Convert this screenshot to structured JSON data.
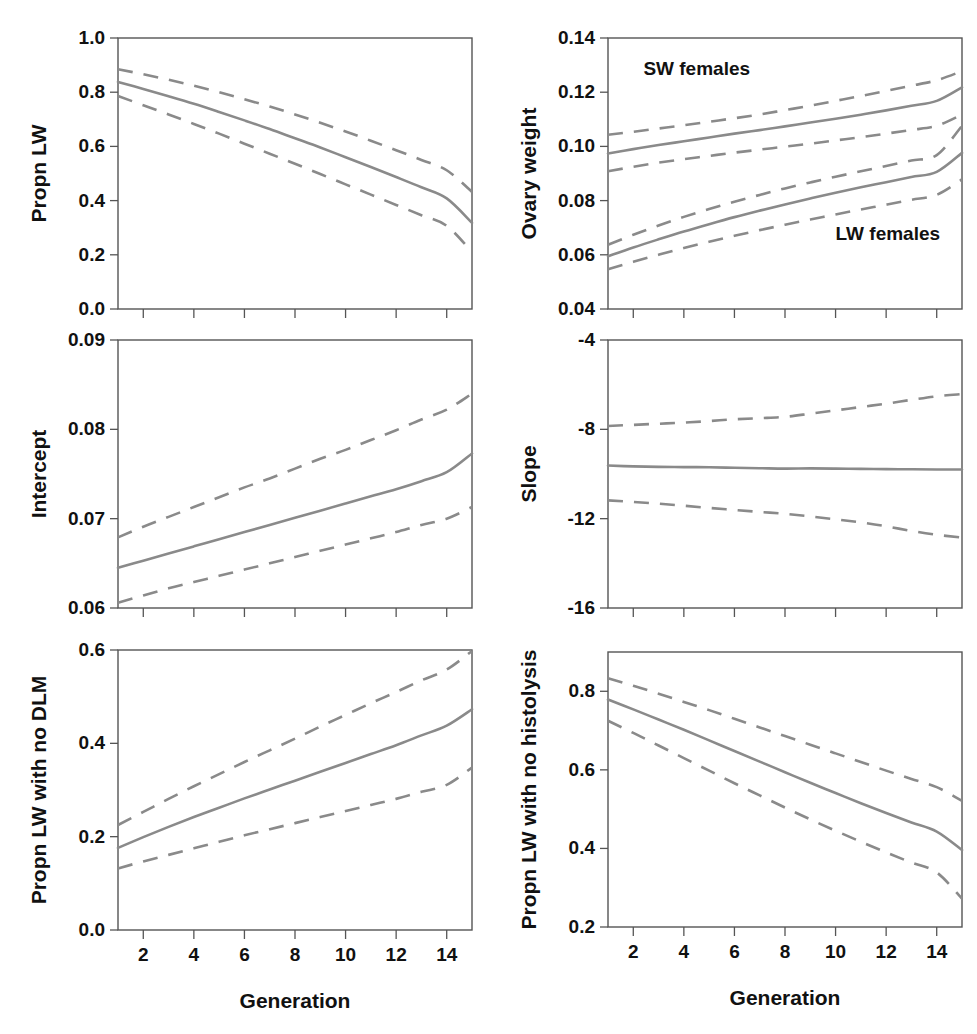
{
  "figure": {
    "width": 977,
    "height": 1034,
    "line_color": "#8a8a8a",
    "axis_color": "#555555",
    "text_color": "#111111",
    "xlabel": "Generation",
    "xticks": [
      2,
      4,
      6,
      8,
      10,
      12,
      14
    ],
    "xtick_labels": [
      "2",
      "4",
      "6",
      "8",
      "10",
      "12",
      "14"
    ],
    "xlim": [
      1,
      15
    ]
  },
  "chart_data": [
    {
      "id": "propn-lw",
      "type": "line",
      "position": "top-left",
      "title": "",
      "xlabel": "Generation",
      "ylabel": "Propn LW",
      "xlim": [
        1,
        15
      ],
      "ylim": [
        0.0,
        1.0
      ],
      "yticks": [
        0.0,
        0.2,
        0.4,
        0.6,
        0.8,
        1.0
      ],
      "ytick_labels": [
        "0.0",
        "0.2",
        "0.4",
        "0.6",
        "0.8",
        "1.0"
      ],
      "x": [
        1,
        2,
        3,
        4,
        5,
        6,
        7,
        8,
        9,
        10,
        11,
        12,
        13,
        14,
        15
      ],
      "grid": false,
      "legend": "none",
      "annotations": [],
      "series": [
        {
          "name": "upper 95% CI",
          "style": "dashed",
          "values": [
            0.885,
            0.866,
            0.846,
            0.824,
            0.8,
            0.774,
            0.747,
            0.718,
            0.687,
            0.655,
            0.621,
            0.586,
            0.55,
            0.512,
            0.432
          ]
        },
        {
          "name": "mean",
          "style": "solid",
          "values": [
            0.838,
            0.812,
            0.785,
            0.757,
            0.727,
            0.696,
            0.664,
            0.63,
            0.596,
            0.56,
            0.524,
            0.487,
            0.449,
            0.408,
            0.318
          ]
        },
        {
          "name": "lower 95% CI",
          "style": "dashed",
          "values": [
            0.786,
            0.752,
            0.718,
            0.683,
            0.647,
            0.61,
            0.573,
            0.536,
            0.498,
            0.46,
            0.422,
            0.384,
            0.346,
            0.307,
            0.21
          ]
        }
      ]
    },
    {
      "id": "ovary-weight",
      "type": "line",
      "position": "top-right",
      "title": "",
      "xlabel": "Generation",
      "ylabel": "Ovary weight",
      "xlim": [
        1,
        15
      ],
      "ylim": [
        0.04,
        0.14
      ],
      "yticks": [
        0.04,
        0.06,
        0.08,
        0.1,
        0.12,
        0.14
      ],
      "ytick_labels": [
        "0.04",
        "0.06",
        "0.08",
        "0.10",
        "0.12",
        "0.14"
      ],
      "x": [
        1,
        2,
        3,
        4,
        5,
        6,
        7,
        8,
        9,
        10,
        11,
        12,
        13,
        14,
        15
      ],
      "grid": false,
      "legend": "inline-annotations",
      "annotations": [
        {
          "text": "SW females",
          "x": 2.4,
          "y": 0.1265
        },
        {
          "text": "LW females",
          "x": 10.0,
          "y": 0.0655
        }
      ],
      "series": [
        {
          "name": "SW females upper 95% CI",
          "style": "dashed",
          "values": [
            0.1043,
            0.1054,
            0.1066,
            0.1078,
            0.1091,
            0.1104,
            0.1118,
            0.1134,
            0.115,
            0.1168,
            0.1186,
            0.1205,
            0.1224,
            0.1244,
            0.1278
          ]
        },
        {
          "name": "SW females mean",
          "style": "solid",
          "values": [
            0.0974,
            0.099,
            0.1005,
            0.1019,
            0.1033,
            0.1047,
            0.106,
            0.1074,
            0.1088,
            0.1102,
            0.1117,
            0.1133,
            0.115,
            0.1168,
            0.1218
          ]
        },
        {
          "name": "SW females lower 95% CI",
          "style": "dashed",
          "values": [
            0.0908,
            0.0925,
            0.094,
            0.0953,
            0.0965,
            0.0977,
            0.0988,
            0.0999,
            0.101,
            0.1022,
            0.1034,
            0.1047,
            0.1061,
            0.1076,
            0.1118
          ]
        },
        {
          "name": "LW females upper 95% CI",
          "style": "dashed",
          "values": [
            0.0637,
            0.0674,
            0.0708,
            0.074,
            0.0769,
            0.0796,
            0.0821,
            0.0845,
            0.0867,
            0.0888,
            0.0908,
            0.0928,
            0.0948,
            0.0968,
            0.1076
          ]
        },
        {
          "name": "LW females mean",
          "style": "solid",
          "values": [
            0.0595,
            0.0627,
            0.0657,
            0.0686,
            0.0713,
            0.0739,
            0.0763,
            0.0786,
            0.0808,
            0.0829,
            0.0849,
            0.0868,
            0.0887,
            0.0906,
            0.0976
          ]
        },
        {
          "name": "LW females lower 95% CI",
          "style": "dashed",
          "values": [
            0.0547,
            0.0574,
            0.06,
            0.0625,
            0.0648,
            0.067,
            0.0691,
            0.0711,
            0.073,
            0.0749,
            0.0767,
            0.0785,
            0.0803,
            0.0821,
            0.0878
          ]
        }
      ]
    },
    {
      "id": "intercept",
      "type": "line",
      "position": "middle-left",
      "title": "",
      "xlabel": "Generation",
      "ylabel": "Intercept",
      "xlim": [
        1,
        15
      ],
      "ylim": [
        0.06,
        0.09
      ],
      "yticks": [
        0.06,
        0.07,
        0.08,
        0.09
      ],
      "ytick_labels": [
        "0.06",
        "0.07",
        "0.08",
        "0.09"
      ],
      "x": [
        1,
        2,
        3,
        4,
        5,
        6,
        7,
        8,
        9,
        10,
        11,
        12,
        13,
        14,
        15
      ],
      "grid": false,
      "legend": "none",
      "annotations": [],
      "series": [
        {
          "name": "upper 95% CI",
          "style": "dashed",
          "values": [
            0.0679,
            0.0691,
            0.0702,
            0.0713,
            0.0724,
            0.0735,
            0.0745,
            0.0756,
            0.0767,
            0.0777,
            0.0788,
            0.0799,
            0.0811,
            0.0822,
            0.084
          ]
        },
        {
          "name": "mean",
          "style": "solid",
          "values": [
            0.0645,
            0.0653,
            0.0661,
            0.0669,
            0.0677,
            0.0685,
            0.0693,
            0.0701,
            0.0709,
            0.0717,
            0.0725,
            0.0733,
            0.0742,
            0.0752,
            0.0773
          ]
        },
        {
          "name": "lower 95% CI",
          "style": "dashed",
          "values": [
            0.0606,
            0.0614,
            0.0622,
            0.0629,
            0.0636,
            0.0643,
            0.065,
            0.0657,
            0.0664,
            0.0671,
            0.0678,
            0.0685,
            0.0693,
            0.07,
            0.0713
          ]
        }
      ]
    },
    {
      "id": "slope",
      "type": "line",
      "position": "middle-right",
      "title": "",
      "xlabel": "Generation",
      "ylabel": "Slope",
      "xlim": [
        1,
        15
      ],
      "ylim": [
        -16,
        -4
      ],
      "yticks": [
        -16,
        -12,
        -8,
        -4
      ],
      "ytick_labels": [
        "-16",
        "-12",
        "-8",
        "-4"
      ],
      "x": [
        1,
        2,
        3,
        4,
        5,
        6,
        7,
        8,
        9,
        10,
        11,
        12,
        13,
        14,
        15
      ],
      "grid": false,
      "legend": "none",
      "annotations": [],
      "series": [
        {
          "name": "upper 95% CI",
          "style": "dashed",
          "values": [
            -7.85,
            -7.8,
            -7.75,
            -7.7,
            -7.63,
            -7.55,
            -7.5,
            -7.44,
            -7.3,
            -7.15,
            -7.0,
            -6.85,
            -6.68,
            -6.52,
            -6.42
          ]
        },
        {
          "name": "mean",
          "style": "solid",
          "values": [
            -9.62,
            -9.66,
            -9.68,
            -9.69,
            -9.7,
            -9.72,
            -9.74,
            -9.76,
            -9.75,
            -9.76,
            -9.77,
            -9.78,
            -9.79,
            -9.8,
            -9.8
          ]
        },
        {
          "name": "lower 95% CI",
          "style": "dashed",
          "values": [
            -11.18,
            -11.25,
            -11.33,
            -11.42,
            -11.52,
            -11.61,
            -11.7,
            -11.78,
            -11.9,
            -12.03,
            -12.17,
            -12.34,
            -12.55,
            -12.72,
            -12.85
          ]
        }
      ]
    },
    {
      "id": "propn-lw-no-dlm",
      "type": "line",
      "position": "bottom-left",
      "title": "",
      "xlabel": "Generation",
      "ylabel": "Propn LW with no DLM",
      "xlim": [
        1,
        15
      ],
      "ylim": [
        0.0,
        0.6
      ],
      "yticks": [
        0.0,
        0.2,
        0.4,
        0.6
      ],
      "ytick_labels": [
        "0.0",
        "0.2",
        "0.4",
        "0.6"
      ],
      "x": [
        1,
        2,
        3,
        4,
        5,
        6,
        7,
        8,
        9,
        10,
        11,
        12,
        13,
        14,
        15
      ],
      "grid": false,
      "legend": "none",
      "annotations": [],
      "series": [
        {
          "name": "upper 95% CI",
          "style": "dashed",
          "values": [
            0.225,
            0.253,
            0.281,
            0.308,
            0.334,
            0.36,
            0.385,
            0.41,
            0.436,
            0.461,
            0.486,
            0.51,
            0.535,
            0.558,
            0.598
          ]
        },
        {
          "name": "mean",
          "style": "solid",
          "values": [
            0.176,
            0.199,
            0.221,
            0.242,
            0.262,
            0.282,
            0.301,
            0.32,
            0.339,
            0.358,
            0.377,
            0.396,
            0.417,
            0.438,
            0.473
          ]
        },
        {
          "name": "lower 95% CI",
          "style": "dashed",
          "values": [
            0.132,
            0.147,
            0.161,
            0.175,
            0.189,
            0.203,
            0.216,
            0.229,
            0.242,
            0.255,
            0.268,
            0.281,
            0.296,
            0.311,
            0.348
          ]
        }
      ]
    },
    {
      "id": "propn-lw-no-histolysis",
      "type": "line",
      "position": "bottom-right",
      "title": "",
      "xlabel": "Generation",
      "ylabel": "Propn LW with no histolysis",
      "xlim": [
        1,
        15
      ],
      "ylim": [
        0.2,
        0.9
      ],
      "yticks": [
        0.2,
        0.4,
        0.6,
        0.8
      ],
      "ytick_labels": [
        "0.2",
        "0.4",
        "0.6",
        "0.8"
      ],
      "x": [
        1,
        2,
        3,
        4,
        5,
        6,
        7,
        8,
        9,
        10,
        11,
        12,
        13,
        14,
        15
      ],
      "grid": false,
      "legend": "none",
      "annotations": [],
      "series": [
        {
          "name": "upper 95% CI",
          "style": "dashed",
          "values": [
            0.833,
            0.814,
            0.794,
            0.773,
            0.752,
            0.73,
            0.708,
            0.686,
            0.664,
            0.642,
            0.62,
            0.598,
            0.577,
            0.556,
            0.521
          ]
        },
        {
          "name": "mean",
          "style": "solid",
          "values": [
            0.779,
            0.754,
            0.728,
            0.702,
            0.675,
            0.648,
            0.621,
            0.594,
            0.567,
            0.541,
            0.515,
            0.49,
            0.466,
            0.443,
            0.396
          ]
        },
        {
          "name": "lower 95% CI",
          "style": "dashed",
          "values": [
            0.725,
            0.694,
            0.662,
            0.63,
            0.598,
            0.566,
            0.535,
            0.504,
            0.474,
            0.445,
            0.417,
            0.39,
            0.364,
            0.339,
            0.272
          ]
        }
      ]
    }
  ]
}
